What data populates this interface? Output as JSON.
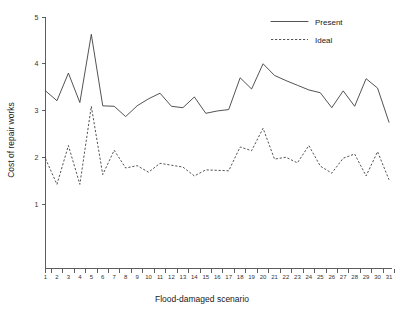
{
  "chart_data": {
    "type": "line",
    "title": "",
    "subtitle": "",
    "xlabel": "Flood-damaged scenario",
    "ylabel": "Cost of repair works",
    "xlim": [
      0.5,
      31.5
    ],
    "ylim": [
      0,
      5
    ],
    "grid": false,
    "legend_position": "top-right",
    "xtick_labels": [
      "1",
      "2",
      "3",
      "4",
      "5",
      "6",
      "7",
      "8",
      "9",
      "10",
      "11",
      "12",
      "13",
      "14",
      "15",
      "16",
      "17",
      "18",
      "19",
      "20",
      "21",
      "22",
      "23",
      "24",
      "25",
      "26",
      "27",
      "28",
      "29",
      "30",
      "31"
    ],
    "ytick_labels": [
      "1",
      "2",
      "3",
      "4",
      "5"
    ],
    "ytick_values": [
      1,
      2,
      3,
      4,
      5
    ],
    "categories": [
      1,
      2,
      3,
      4,
      5,
      6,
      7,
      8,
      9,
      10,
      11,
      12,
      13,
      14,
      15,
      16,
      17,
      18,
      19,
      20,
      21,
      22,
      23,
      24,
      25,
      26,
      27,
      28,
      29,
      30,
      31
    ],
    "series": [
      {
        "name": "Present",
        "style": "solid",
        "color": "#3f3f3f",
        "values": [
          3.42,
          3.21,
          3.8,
          3.17,
          4.63,
          3.1,
          3.09,
          2.87,
          3.1,
          3.25,
          3.37,
          3.09,
          3.06,
          3.29,
          2.94,
          2.99,
          3.02,
          3.7,
          3.46,
          4.0,
          3.75,
          3.64,
          3.54,
          3.44,
          3.38,
          3.06,
          3.42,
          3.09,
          3.68,
          3.48,
          2.75
        ]
      },
      {
        "name": "Ideal",
        "style": "dashed",
        "color": "#3f3f3f",
        "values": [
          1.97,
          1.42,
          2.25,
          1.42,
          3.09,
          1.63,
          2.15,
          1.77,
          1.82,
          1.68,
          1.87,
          1.83,
          1.79,
          1.6,
          1.73,
          1.72,
          1.71,
          2.22,
          2.14,
          2.62,
          1.96,
          2.0,
          1.88,
          2.25,
          1.81,
          1.66,
          1.98,
          2.07,
          1.6,
          2.12,
          1.52
        ]
      }
    ]
  },
  "legend": {
    "entries": [
      {
        "label": "Present",
        "style": "solid"
      },
      {
        "label": "Ideal",
        "style": "dashed"
      }
    ]
  },
  "axes": {
    "x_title": "Flood-damaged scenario",
    "y_title": "Cost of repair works"
  }
}
